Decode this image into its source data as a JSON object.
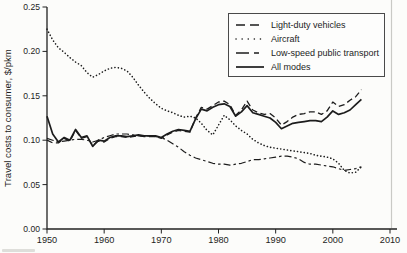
{
  "chart_data": {
    "type": "line",
    "title": "",
    "xlabel": "",
    "ylabel": "Travel costs to consumer, $/pkm",
    "xlim": [
      1950,
      2010
    ],
    "ylim": [
      0,
      0.25
    ],
    "xticks": [
      1950,
      1960,
      1970,
      1980,
      1990,
      2000,
      2010
    ],
    "ytick_labels": [
      "0.00",
      "0.05",
      "0.10",
      "0.15",
      "0.20",
      "0.25"
    ],
    "grid": false,
    "legend_position": "top-right",
    "line_color": "#1c1c1c",
    "x": [
      1950,
      1951,
      1952,
      1953,
      1954,
      1955,
      1956,
      1957,
      1958,
      1959,
      1960,
      1961,
      1962,
      1963,
      1964,
      1965,
      1966,
      1967,
      1968,
      1969,
      1970,
      1971,
      1972,
      1973,
      1974,
      1975,
      1976,
      1977,
      1978,
      1979,
      1980,
      1981,
      1982,
      1983,
      1984,
      1985,
      1986,
      1987,
      1988,
      1989,
      1990,
      1991,
      1992,
      1993,
      1994,
      1995,
      1996,
      1997,
      1998,
      1999,
      2000,
      2001,
      2002,
      2003,
      2004,
      2005
    ],
    "series": [
      {
        "name": "Light-duty vehicles",
        "dash": "long-dash",
        "values": [
          0.1,
          0.097,
          0.097,
          0.102,
          0.099,
          0.111,
          0.102,
          0.104,
          0.094,
          0.099,
          0.098,
          0.102,
          0.104,
          0.104,
          0.103,
          0.104,
          0.105,
          0.104,
          0.104,
          0.104,
          0.102,
          0.106,
          0.109,
          0.111,
          0.11,
          0.109,
          0.125,
          0.137,
          0.135,
          0.139,
          0.143,
          0.144,
          0.14,
          0.128,
          0.134,
          0.144,
          0.134,
          0.131,
          0.129,
          0.13,
          0.125,
          0.117,
          0.121,
          0.126,
          0.129,
          0.13,
          0.132,
          0.132,
          0.129,
          0.133,
          0.143,
          0.138,
          0.14,
          0.145,
          0.149,
          0.157
        ]
      },
      {
        "name": "Aircraft",
        "dash": "dotted",
        "values": [
          0.225,
          0.213,
          0.204,
          0.199,
          0.193,
          0.188,
          0.184,
          0.176,
          0.171,
          0.174,
          0.178,
          0.181,
          0.182,
          0.181,
          0.178,
          0.171,
          0.162,
          0.154,
          0.147,
          0.141,
          0.136,
          0.133,
          0.131,
          0.128,
          0.126,
          0.127,
          0.125,
          0.119,
          0.111,
          0.106,
          0.117,
          0.128,
          0.123,
          0.116,
          0.111,
          0.107,
          0.101,
          0.097,
          0.094,
          0.092,
          0.091,
          0.09,
          0.089,
          0.088,
          0.087,
          0.086,
          0.085,
          0.083,
          0.082,
          0.081,
          0.079,
          0.074,
          0.066,
          0.063,
          0.064,
          0.07
        ]
      },
      {
        "name": "Low-speed public transport",
        "dash": "dash-dot",
        "values": [
          0.102,
          0.1,
          0.098,
          0.099,
          0.1,
          0.101,
          0.101,
          0.1,
          0.098,
          0.1,
          0.103,
          0.105,
          0.107,
          0.107,
          0.107,
          0.106,
          0.105,
          0.105,
          0.105,
          0.104,
          0.103,
          0.1,
          0.096,
          0.092,
          0.087,
          0.083,
          0.08,
          0.078,
          0.076,
          0.074,
          0.073,
          0.073,
          0.072,
          0.073,
          0.074,
          0.076,
          0.078,
          0.078,
          0.079,
          0.08,
          0.081,
          0.082,
          0.082,
          0.081,
          0.079,
          0.075,
          0.073,
          0.073,
          0.072,
          0.071,
          0.07,
          0.068,
          0.066,
          0.067,
          0.068,
          0.07
        ]
      },
      {
        "name": "All modes",
        "dash": "solid",
        "values": [
          0.127,
          0.107,
          0.098,
          0.103,
          0.1,
          0.112,
          0.103,
          0.105,
          0.093,
          0.1,
          0.099,
          0.103,
          0.105,
          0.105,
          0.104,
          0.105,
          0.106,
          0.105,
          0.105,
          0.105,
          0.103,
          0.107,
          0.11,
          0.112,
          0.111,
          0.11,
          0.124,
          0.135,
          0.133,
          0.137,
          0.14,
          0.141,
          0.138,
          0.127,
          0.132,
          0.139,
          0.131,
          0.129,
          0.127,
          0.125,
          0.12,
          0.113,
          0.116,
          0.119,
          0.12,
          0.121,
          0.122,
          0.122,
          0.121,
          0.126,
          0.133,
          0.129,
          0.131,
          0.134,
          0.14,
          0.146
        ]
      }
    ]
  }
}
